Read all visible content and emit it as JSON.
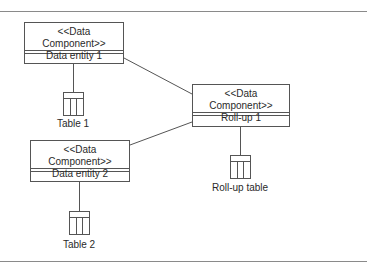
{
  "diagram": {
    "components": [
      {
        "id": "entity1",
        "stereotype": "<<Data Component>>",
        "name": "Data entity 1"
      },
      {
        "id": "rollup1",
        "stereotype": "<<Data Component>>",
        "name": "Roll-up 1"
      },
      {
        "id": "entity2",
        "stereotype": "<<Data Component>>",
        "name": "Data entity 2"
      }
    ],
    "tables": [
      {
        "id": "table1",
        "label": "Table 1",
        "attached_to": "entity1"
      },
      {
        "id": "rolluptable",
        "label": "Roll-up table",
        "attached_to": "rollup1"
      },
      {
        "id": "table2",
        "label": "Table 2",
        "attached_to": "entity2"
      }
    ],
    "connections": [
      {
        "from": "entity1",
        "to": "rollup1"
      },
      {
        "from": "entity2",
        "to": "rollup1"
      }
    ],
    "colors": {
      "line": "#555555",
      "rule": "#8a8a8a"
    }
  }
}
